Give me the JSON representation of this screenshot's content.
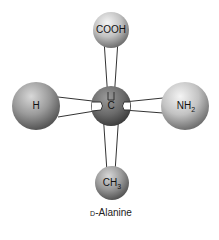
{
  "molecule": {
    "name_prefix": "D",
    "name_rest": "-Alanine",
    "center": {
      "label": "C",
      "x": 111,
      "y": 106,
      "r": 20,
      "color": "#6e6e6e"
    },
    "groups": [
      {
        "id": "cooh",
        "label": "COOH",
        "sub": "",
        "x": 111,
        "y": 30,
        "r": 18
      },
      {
        "id": "h",
        "label": "H",
        "sub": "",
        "x": 36,
        "y": 106,
        "r": 24
      },
      {
        "id": "nh2",
        "label": "NH",
        "sub": "2",
        "x": 185,
        "y": 106,
        "r": 24
      },
      {
        "id": "ch3",
        "label": "CH",
        "sub": "3",
        "x": 112,
        "y": 183,
        "r": 17
      }
    ]
  }
}
